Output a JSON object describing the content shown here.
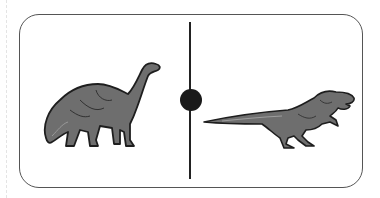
{
  "figure": {
    "type": "comparison-card",
    "left_panel": {
      "subject": "sauropod-dinosaur",
      "label": ""
    },
    "right_panel": {
      "subject": "theropod-dinosaur",
      "label": ""
    },
    "center_marker": "filled-circle",
    "colors": {
      "border": "#555555",
      "divider": "#222222",
      "dino_fill": "#6e6e6e",
      "dino_outline": "#1e1e1e"
    }
  }
}
